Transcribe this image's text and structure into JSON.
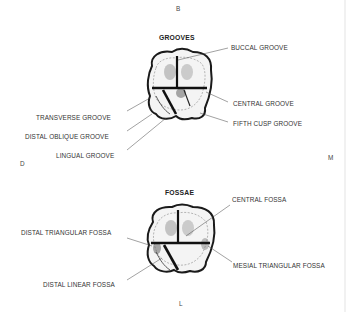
{
  "directions": {
    "top": "B",
    "left": "D",
    "right": "M",
    "bottom": "L"
  },
  "panels": [
    {
      "title": "GROOVES",
      "labels": [
        "BUCCAL GROOVE",
        "CENTRAL GROOVE",
        "FIFTH CUSP GROOVE",
        "TRANSVERSE GROOVE",
        "DISTAL OBLIQUE GROOVE",
        "LINGUAL GROOVE"
      ]
    },
    {
      "title": "FOSSAE",
      "labels": [
        "CENTRAL FOSSA",
        "DISTAL TRIANGULAR FOSSA",
        "MESIAL TRIANGULAR FOSSA",
        "DISTAL LINEAR FOSSA"
      ]
    }
  ]
}
